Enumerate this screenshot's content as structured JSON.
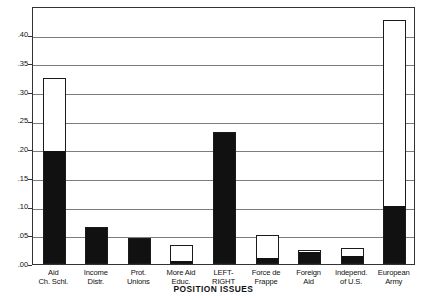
{
  "chart_data": {
    "type": "bar",
    "title": "",
    "subtitle": "",
    "xlabel": "POSITION ISSUES",
    "ylabel": "",
    "ylim": [
      0.0,
      0.45
    ],
    "grid": true,
    "legend_position": "none",
    "stacked": true,
    "categories": [
      "Aid Ch. Schl.",
      "Income Distr.",
      "Prot. Unions",
      "More Aid Educ.",
      "LEFT-RIGHT",
      "Force de Frappe",
      "Foreign Aid",
      "Independ. of U.S.",
      "European Army"
    ],
    "category_lines": [
      [
        "Aid",
        "Ch. Schl."
      ],
      [
        "Income",
        "Distr."
      ],
      [
        "Prot.",
        "Unions"
      ],
      [
        "More Aid",
        "Educ."
      ],
      [
        "LEFT-",
        "RIGHT"
      ],
      [
        "Force de",
        "Frappe"
      ],
      [
        "Foreign",
        "Aid"
      ],
      [
        "Independ.",
        "of U.S."
      ],
      [
        "European",
        "Army"
      ]
    ],
    "series": [
      {
        "name": "filled (black)",
        "color": "#111111",
        "values": [
          0.195,
          0.065,
          0.043,
          0.004,
          0.23,
          0.008,
          0.02,
          0.012,
          0.1
        ]
      },
      {
        "name": "open (white)",
        "color": "#ffffff",
        "values": [
          0.13,
          0.0,
          0.002,
          0.029,
          0.0,
          0.043,
          0.004,
          0.016,
          0.325
        ]
      }
    ],
    "totals": [
      0.325,
      0.065,
      0.045,
      0.033,
      0.23,
      0.051,
      0.024,
      0.028,
      0.425
    ],
    "ytick_values": [
      0.0,
      0.05,
      0.1,
      0.15,
      0.2,
      0.25,
      0.3,
      0.35,
      0.4
    ],
    "ytick_labels": [
      ".00",
      ".05",
      ".10",
      ".15",
      ".20",
      ".25",
      ".30",
      ".35",
      ".40"
    ]
  }
}
